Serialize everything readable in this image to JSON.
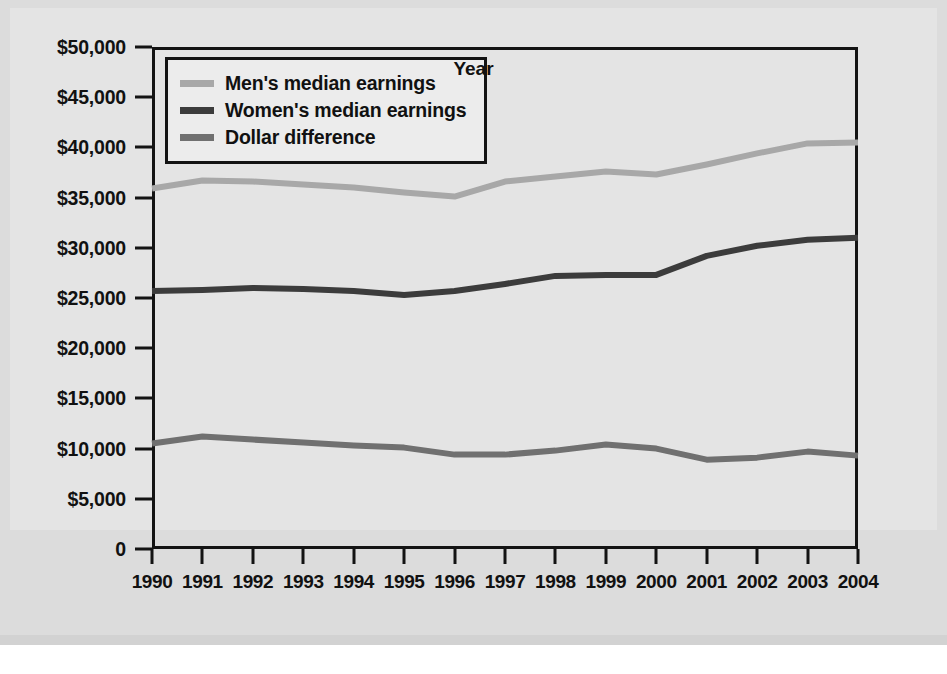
{
  "chart_data": {
    "type": "line",
    "title": "",
    "xlabel": "Year",
    "ylabel": "",
    "grid": false,
    "legend_position": "top-left",
    "categories": [
      1990,
      1991,
      1992,
      1993,
      1994,
      1995,
      1996,
      1997,
      1998,
      1999,
      2000,
      2001,
      2002,
      2003,
      2004
    ],
    "xlim": [
      1990,
      2004
    ],
    "ylim": [
      0,
      50000
    ],
    "ytick_values": [
      0,
      5000,
      10000,
      15000,
      20000,
      25000,
      30000,
      35000,
      40000,
      45000,
      50000
    ],
    "ytick_labels": [
      "0",
      "$5,000",
      "$10,000",
      "$15,000",
      "$20,000",
      "$25,000",
      "$30,000",
      "$35,000",
      "$40,000",
      "$45,000",
      "$50,000"
    ],
    "xtick_labels": [
      "1990",
      "1991",
      "1992",
      "1993",
      "1994",
      "1995",
      "1996",
      "1997",
      "1998",
      "1999",
      "2000",
      "2001",
      "2002",
      "2003",
      "2004"
    ],
    "series": [
      {
        "name": "Men's median earnings",
        "color": "#a8a8a8",
        "values": [
          35900,
          36700,
          36600,
          36300,
          36000,
          35500,
          35100,
          36600,
          37100,
          37600,
          37300,
          38300,
          39400,
          40400,
          40500
        ]
      },
      {
        "name": "Women's median earnings",
        "color": "#3c3c3c",
        "values": [
          25700,
          25800,
          26000,
          25900,
          25700,
          25300,
          25700,
          26400,
          27200,
          27300,
          27300,
          29200,
          30200,
          30800,
          31000
        ]
      },
      {
        "name": "Dollar difference",
        "color": "#707070",
        "values": [
          10500,
          11200,
          10900,
          10600,
          10300,
          10100,
          9400,
          9400,
          9800,
          10400,
          10000,
          8900,
          9100,
          9700,
          9300
        ]
      }
    ]
  },
  "legend": {
    "items": [
      {
        "label": "Men's median earnings",
        "color": "#a8a8a8"
      },
      {
        "label": "Women's median earnings",
        "color": "#3c3c3c"
      },
      {
        "label": "Dollar difference",
        "color": "#707070"
      }
    ]
  },
  "axes": {
    "x_title": "Year"
  }
}
